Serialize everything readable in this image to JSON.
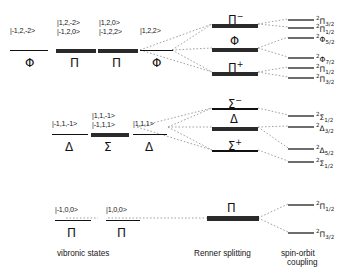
{
  "figure": {
    "type": "energy-level-correlation-diagram"
  },
  "captions": {
    "vibronic": "vibronic  states",
    "renner": "Renner  splitting",
    "spin_orbit_line1": "spin-orbit",
    "spin_orbit_line2": "coupling"
  },
  "blocks": {
    "phi": {
      "kets": {
        "col1": "|-1,2,-2>",
        "col2_top": "|1,2,-2>",
        "col2_bottom": "|-1,2,0>",
        "col3_top": "|1,2,0>",
        "col3_bottom": "|-1,2,2>",
        "col4": "|1,2,2>"
      },
      "symbols": {
        "col1": "Φ",
        "col2": "Π",
        "col3": "Π",
        "col4": "Φ"
      },
      "renner": {
        "top": "Π",
        "top_sup": "−",
        "middle": "Φ",
        "middle_sup": "",
        "bottom": "Π",
        "bottom_sup": "+"
      },
      "terms": [
        {
          "pre": "2",
          "letter": "Π",
          "sub": "3/2"
        },
        {
          "pre": "2",
          "letter": "Π",
          "sub": "1/2"
        },
        {
          "pre": "2",
          "letter": "Φ",
          "sub": "5/2"
        },
        {
          "pre": "2",
          "letter": "Φ",
          "sub": "7/2"
        },
        {
          "pre": "2",
          "letter": "Π",
          "sub": "1/2"
        },
        {
          "pre": "2",
          "letter": "Π",
          "sub": "3/2"
        }
      ]
    },
    "delta": {
      "kets": {
        "col1": "|-1,1,-1>",
        "col2_top": "|1,1,-1>",
        "col2_bottom": "|-1,1,1>",
        "col3": "|1,1,1>"
      },
      "symbols": {
        "col1": "Δ",
        "col2": "Σ",
        "col3": "Δ"
      },
      "renner": {
        "top": "Σ",
        "top_sup": "−",
        "middle": "Δ",
        "middle_sup": "",
        "bottom": "Σ",
        "bottom_sup": "+"
      },
      "terms": [
        {
          "pre": "2",
          "letter": "Σ",
          "sub": "1/2"
        },
        {
          "pre": "2",
          "letter": "Δ",
          "sub": "3/2"
        },
        {
          "pre": "2",
          "letter": "Δ",
          "sub": "5/2"
        },
        {
          "pre": "2",
          "letter": "Σ",
          "sub": "1/2"
        }
      ]
    },
    "pi": {
      "kets": {
        "col1": "|-1,0,0>",
        "col2": "|1,0,0>"
      },
      "symbols": {
        "col1": "Π",
        "col2": "Π"
      },
      "renner": {
        "center": "Π"
      },
      "terms": [
        {
          "pre": "2",
          "letter": "Π",
          "sub": "1/2"
        },
        {
          "pre": "2",
          "letter": "Π",
          "sub": "3/2"
        }
      ]
    }
  }
}
